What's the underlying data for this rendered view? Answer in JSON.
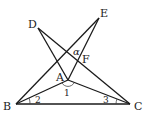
{
  "diagram": {
    "points": {
      "A": {
        "label": "A",
        "x": 68,
        "y": 80
      },
      "B": {
        "label": "B",
        "x": 16,
        "y": 104
      },
      "C": {
        "label": "C",
        "x": 130,
        "y": 104
      },
      "D": {
        "label": "D",
        "x": 38,
        "y": 28
      },
      "E": {
        "label": "E",
        "x": 99,
        "y": 18
      },
      "F": {
        "label": "F"
      }
    },
    "segments": [
      "BC",
      "BE",
      "BA",
      "CA",
      "CD",
      "DA",
      "AE"
    ],
    "angle_labels": {
      "angle1": "1",
      "angle2": "2",
      "angle3": "3",
      "alpha": "α"
    }
  }
}
